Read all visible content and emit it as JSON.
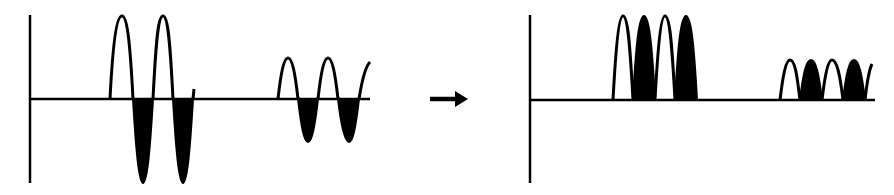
{
  "colors": {
    "stroke": "#000000",
    "fill": "#000000",
    "background": "#ffffff"
  },
  "panels": [
    {
      "name": "input",
      "description": "Alternating signal with positive (open) and negative (filled) half-cycles",
      "axis": {
        "x": 30,
        "y_top": 15,
        "y_bottom": 183,
        "baseline_y": 99,
        "baseline_end_x": 370
      },
      "bursts": [
        {
          "amplitude": "large",
          "start_x": 110,
          "half_period": 20,
          "half_cycles": [
            "positive",
            "negative",
            "positive",
            "negative"
          ],
          "peak_y": 16,
          "trough_y": 183
        },
        {
          "amplitude": "small",
          "start_x": 278,
          "half_period": 20,
          "half_cycles": [
            "positive",
            "negative",
            "positive",
            "negative"
          ],
          "peak_y": 58,
          "trough_y": 142
        }
      ]
    },
    {
      "name": "output",
      "description": "Rectified signal: negative half-cycles flipped to positive (filled)",
      "axis": {
        "x": 530,
        "y_top": 15,
        "y_bottom": 183,
        "baseline_y": 100,
        "baseline_end_x": 875
      },
      "bursts": [
        {
          "amplitude": "large",
          "start_x": 613,
          "half_period": 21,
          "half_cycles": [
            "open",
            "filled",
            "open",
            "filled"
          ],
          "peak_y": 16
        },
        {
          "amplitude": "small",
          "start_x": 780,
          "half_period": 21,
          "half_cycles": [
            "open",
            "filled",
            "open",
            "filled"
          ],
          "peak_y": 60
        }
      ]
    }
  ],
  "arrow": {
    "icon": "right-arrow-icon",
    "x1": 430,
    "x2": 467,
    "y": 99
  }
}
